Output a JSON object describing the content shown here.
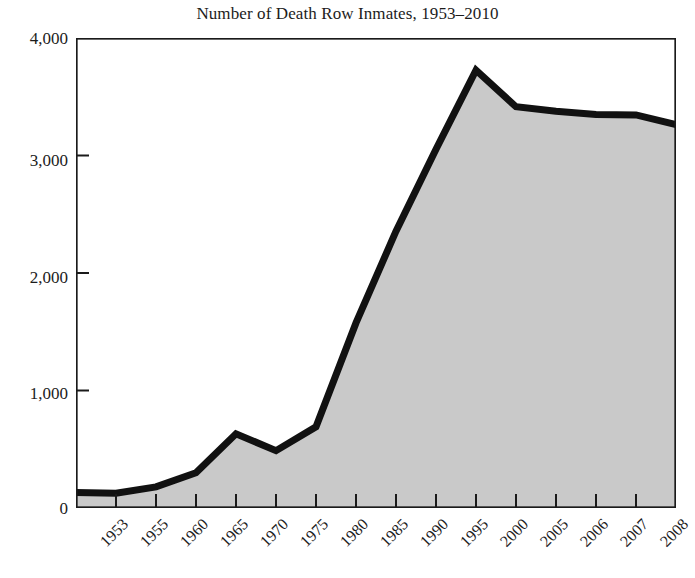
{
  "chart_data": {
    "type": "area",
    "title": "Number of Death Row Inmates, 1953–2010",
    "xlabel": "",
    "ylabel": "",
    "categories": [
      "1953",
      "1955",
      "1960",
      "1965",
      "1970",
      "1975",
      "1980",
      "1985",
      "1990",
      "1995",
      "2000",
      "2005",
      "2006",
      "2007",
      "2008",
      "2009"
    ],
    "values": [
      131,
      125,
      180,
      300,
      631,
      488,
      691,
      1575,
      2356,
      3054,
      3726,
      3415,
      3376,
      3350,
      3345,
      3263
    ],
    "series": [
      {
        "name": "Death row inmates",
        "values": [
          131,
          125,
          180,
          300,
          631,
          488,
          691,
          1575,
          2356,
          3054,
          3726,
          3415,
          3376,
          3350,
          3345,
          3263
        ]
      }
    ],
    "ylim": [
      0,
      4000
    ],
    "ytick_values": [
      0,
      1000,
      2000,
      3000,
      4000
    ],
    "ytick_labels": [
      "0",
      "1,000",
      "2,000",
      "3,000",
      "4,000"
    ],
    "grid": false,
    "legend": false,
    "legend_position": "none",
    "fill_color": "#c9c9c9",
    "line_color": "#111111",
    "axis_color": "#1a1a1a",
    "background_color": "#ffffff",
    "annotations": []
  }
}
